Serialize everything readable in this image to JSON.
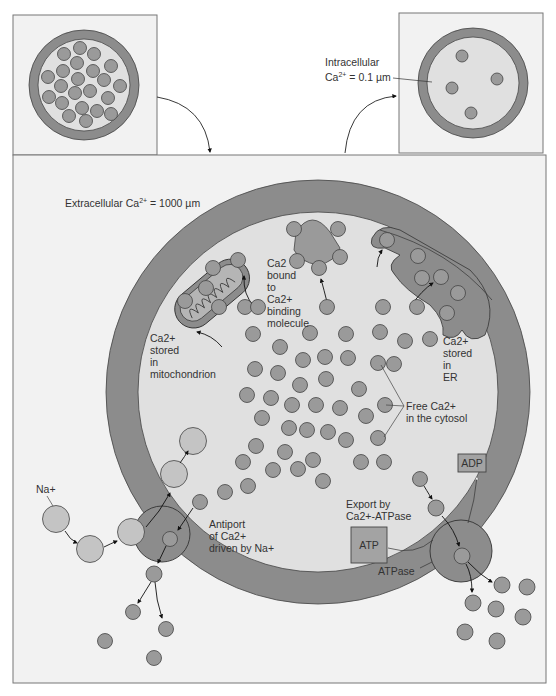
{
  "figure": {
    "colors": {
      "panel_bg": "#f2f2f2",
      "panel_border": "#777777",
      "membrane": "#8c8c8c",
      "cytosol": "#e0e0e0",
      "ca_ion": "#9a9a9a",
      "na_ion": "#c4c4c4",
      "transporter": "#888888",
      "box_fill": "#a3a3a3"
    },
    "top_left_panel": {
      "description": "cell with high calcium"
    },
    "top_right_panel": {
      "label_line1": "Intracellular",
      "label_ca": "Ca",
      "label_sup": "2+",
      "label_value": " = 0.1 µm"
    },
    "main_panel": {
      "extracellular_label": "Extracellular Ca",
      "extracellular_sup": "2+",
      "extracellular_value": " = 1000 µm",
      "bound_label": [
        "Ca2",
        "bound",
        "to",
        "Ca2+",
        "binding",
        "molecule"
      ],
      "mito_label": [
        "Ca2+",
        "stored",
        "in",
        "mitochondrion"
      ],
      "er_label": [
        "Ca2+",
        "stored",
        "in",
        "ER"
      ],
      "free_label_1": "Free Ca2+",
      "free_label_2": "in the cytosol",
      "na_label": "Na+",
      "antiport_label": [
        "Antiport",
        "of Ca2+",
        "driven by Na+"
      ],
      "export_label_1": "Export by",
      "export_label_2": "Ca2+-ATPase",
      "atp_label": "ATP",
      "adp_label": "ADP",
      "atpase_label": "ATPase"
    }
  }
}
